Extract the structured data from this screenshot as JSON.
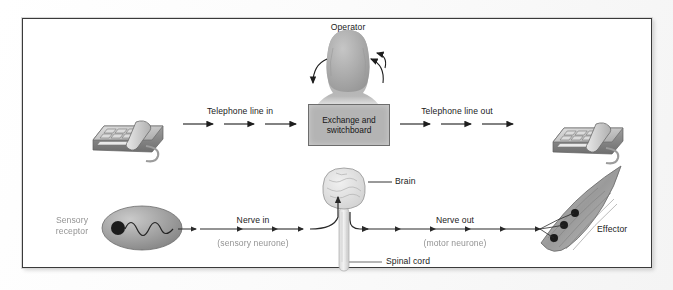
{
  "figure": {
    "border_color": "#3a3a3a",
    "accent_gray": "#b4b4b4"
  },
  "top_row": {
    "caption_operator": "Operator",
    "label_line_in": "Telephone line in",
    "label_line_out": "Telephone line out",
    "exchange_line1": "Exchange and",
    "exchange_line2": "switchboard",
    "phone_left_name": "telephone-left",
    "phone_right_name": "telephone-right",
    "arrows_in": 3,
    "arrows_out": 3
  },
  "bottom_row": {
    "label_receptor_line1": "Sensory",
    "label_receptor_line2": "receptor",
    "label_nerve_in": "Nerve in",
    "label_nerve_in_sub": "(sensory neurone)",
    "label_nerve_out": "Nerve out",
    "label_nerve_out_sub": "(motor neurone)",
    "label_brain": "Brain",
    "label_spinal_cord": "Spinal cord",
    "label_effector": "Effector"
  }
}
